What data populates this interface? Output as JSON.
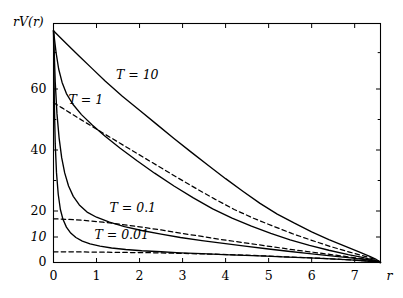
{
  "chart_data": {
    "type": "line",
    "title": "",
    "xlabel": "r",
    "ylabel": "rV(r)",
    "xlim": [
      0,
      7.6
    ],
    "ylim": [
      0,
      78
    ],
    "grid": false,
    "legend_position": "inline-annotations",
    "x_ticks": [
      "0",
      "1",
      "2",
      "3",
      "4",
      "5",
      "6",
      "7"
    ],
    "x_tick_values": [
      0,
      1,
      2,
      3,
      4,
      5,
      6,
      7
    ],
    "y_ticks": [
      "0",
      "10",
      "20",
      "40",
      "60"
    ],
    "y_tick_values": [
      0,
      10,
      20,
      40,
      60
    ],
    "y_minor_tick_values": [
      30,
      50,
      70
    ],
    "annotations": [
      {
        "text": "T = 10",
        "x": 1.45,
        "y": 63.5
      },
      {
        "text": "T = 1",
        "x": 0.35,
        "y": 56.0
      },
      {
        "text": "T = 0.1",
        "x": 1.3,
        "y": 20.5
      },
      {
        "text": "T = 0.01",
        "x": 0.95,
        "y": 10.5
      }
    ],
    "series": [
      {
        "name": "T = 10",
        "style": "solid",
        "color": "#000000",
        "points": [
          [
            0.0,
            76.0
          ],
          [
            0.15,
            74.2
          ],
          [
            0.35,
            71.9
          ],
          [
            0.6,
            69.0
          ],
          [
            0.9,
            65.6
          ],
          [
            1.2,
            62.2
          ],
          [
            1.6,
            57.6
          ],
          [
            2.0,
            53.0
          ],
          [
            2.4,
            48.4
          ],
          [
            2.8,
            43.8
          ],
          [
            3.2,
            39.3
          ],
          [
            3.6,
            34.9
          ],
          [
            4.0,
            30.6
          ],
          [
            4.4,
            26.5
          ],
          [
            4.8,
            22.5
          ],
          [
            5.2,
            18.8
          ],
          [
            5.6,
            15.3
          ],
          [
            6.0,
            12.0
          ],
          [
            6.4,
            9.0
          ],
          [
            6.8,
            6.2
          ],
          [
            7.1,
            4.2
          ],
          [
            7.35,
            2.4
          ],
          [
            7.5,
            1.2
          ],
          [
            7.58,
            0.3
          ],
          [
            7.6,
            0.0
          ]
        ]
      },
      {
        "name": "T = 1",
        "style": "solid",
        "color": "#000000",
        "points": [
          [
            0.0,
            76.0
          ],
          [
            0.06,
            70.0
          ],
          [
            0.12,
            65.5
          ],
          [
            0.2,
            61.8
          ],
          [
            0.3,
            58.5
          ],
          [
            0.45,
            55.0
          ],
          [
            0.65,
            51.6
          ],
          [
            0.9,
            48.2
          ],
          [
            1.2,
            44.5
          ],
          [
            1.55,
            40.6
          ],
          [
            1.95,
            36.4
          ],
          [
            2.35,
            32.4
          ],
          [
            2.8,
            28.2
          ],
          [
            3.25,
            24.3
          ],
          [
            3.7,
            20.7
          ],
          [
            4.15,
            17.3
          ],
          [
            4.6,
            14.2
          ],
          [
            5.05,
            11.4
          ],
          [
            5.5,
            8.9
          ],
          [
            5.95,
            6.7
          ],
          [
            6.4,
            4.8
          ],
          [
            6.85,
            3.1
          ],
          [
            7.15,
            2.1
          ],
          [
            7.4,
            1.1
          ],
          [
            7.55,
            0.4
          ],
          [
            7.6,
            0.0
          ]
        ]
      },
      {
        "name": "T = 1 asymptote",
        "style": "dashed",
        "color": "#000000",
        "points": [
          [
            0.0,
            55.5
          ],
          [
            0.2,
            53.8
          ],
          [
            0.45,
            51.6
          ],
          [
            0.75,
            49.0
          ],
          [
            1.1,
            46.0
          ],
          [
            1.5,
            42.6
          ],
          [
            1.95,
            38.8
          ],
          [
            2.4,
            35.0
          ],
          [
            2.85,
            31.2
          ],
          [
            3.3,
            27.5
          ],
          [
            3.75,
            23.9
          ],
          [
            4.2,
            20.5
          ],
          [
            4.65,
            17.2
          ],
          [
            5.1,
            14.2
          ],
          [
            5.55,
            11.3
          ],
          [
            6.0,
            8.7
          ],
          [
            6.45,
            6.2
          ],
          [
            6.9,
            4.0
          ],
          [
            7.2,
            2.6
          ],
          [
            7.45,
            1.3
          ],
          [
            7.6,
            0.3
          ]
        ]
      },
      {
        "name": "T = 0.1",
        "style": "solid",
        "color": "#000000",
        "points": [
          [
            0.0,
            76.0
          ],
          [
            0.04,
            62.0
          ],
          [
            0.08,
            52.0
          ],
          [
            0.13,
            44.0
          ],
          [
            0.19,
            37.5
          ],
          [
            0.26,
            32.5
          ],
          [
            0.35,
            28.2
          ],
          [
            0.46,
            24.8
          ],
          [
            0.6,
            22.0
          ],
          [
            0.78,
            19.6
          ],
          [
            1.0,
            17.6
          ],
          [
            1.3,
            15.7
          ],
          [
            1.65,
            14.0
          ],
          [
            2.05,
            12.5
          ],
          [
            2.5,
            11.1
          ],
          [
            2.95,
            9.8
          ],
          [
            3.45,
            8.6
          ],
          [
            3.95,
            7.5
          ],
          [
            4.45,
            6.4
          ],
          [
            4.95,
            5.4
          ],
          [
            5.45,
            4.4
          ],
          [
            5.95,
            3.5
          ],
          [
            6.45,
            2.6
          ],
          [
            6.9,
            1.8
          ],
          [
            7.2,
            1.2
          ],
          [
            7.45,
            0.6
          ],
          [
            7.6,
            0.1
          ]
        ]
      },
      {
        "name": "T = 0.1 asymptote",
        "style": "dashed",
        "color": "#000000",
        "points": [
          [
            0.0,
            17.0
          ],
          [
            0.3,
            16.8
          ],
          [
            0.7,
            16.4
          ],
          [
            1.15,
            15.7
          ],
          [
            1.6,
            14.8
          ],
          [
            2.05,
            13.8
          ],
          [
            2.5,
            12.7
          ],
          [
            2.95,
            11.5
          ],
          [
            3.45,
            10.2
          ],
          [
            3.95,
            8.9
          ],
          [
            4.45,
            7.7
          ],
          [
            4.95,
            6.5
          ],
          [
            5.45,
            5.3
          ],
          [
            5.95,
            4.2
          ],
          [
            6.45,
            3.1
          ],
          [
            6.9,
            2.1
          ],
          [
            7.2,
            1.4
          ],
          [
            7.45,
            0.7
          ],
          [
            7.6,
            0.1
          ]
        ]
      },
      {
        "name": "T = 0.01",
        "style": "solid",
        "color": "#000000",
        "points": [
          [
            0.0,
            76.0
          ],
          [
            0.02,
            55.0
          ],
          [
            0.04,
            42.0
          ],
          [
            0.07,
            32.5
          ],
          [
            0.11,
            25.5
          ],
          [
            0.16,
            20.5
          ],
          [
            0.22,
            16.8
          ],
          [
            0.3,
            13.8
          ],
          [
            0.4,
            11.5
          ],
          [
            0.52,
            9.8
          ],
          [
            0.67,
            8.4
          ],
          [
            0.85,
            7.3
          ],
          [
            1.08,
            6.4
          ],
          [
            1.35,
            5.7
          ],
          [
            1.68,
            5.1
          ],
          [
            2.05,
            4.6
          ],
          [
            2.5,
            4.2
          ],
          [
            2.95,
            3.8
          ],
          [
            3.45,
            3.5
          ],
          [
            3.95,
            3.1
          ],
          [
            4.45,
            2.8
          ],
          [
            4.95,
            2.5
          ],
          [
            5.45,
            2.1
          ],
          [
            5.95,
            1.8
          ],
          [
            6.45,
            1.4
          ],
          [
            6.9,
            1.0
          ],
          [
            7.2,
            0.7
          ],
          [
            7.45,
            0.3
          ],
          [
            7.6,
            0.0
          ]
        ]
      },
      {
        "name": "T = 0.01 asymptote",
        "style": "dashed",
        "color": "#000000",
        "points": [
          [
            0.0,
            4.2
          ],
          [
            0.4,
            4.2
          ],
          [
            0.9,
            4.1
          ],
          [
            1.4,
            4.0
          ],
          [
            1.9,
            3.9
          ],
          [
            2.4,
            3.8
          ],
          [
            2.9,
            3.6
          ],
          [
            3.4,
            3.4
          ],
          [
            3.9,
            3.2
          ],
          [
            4.4,
            2.9
          ],
          [
            4.9,
            2.6
          ],
          [
            5.4,
            2.2
          ],
          [
            5.9,
            1.9
          ],
          [
            6.4,
            1.5
          ],
          [
            6.9,
            1.0
          ],
          [
            7.2,
            0.7
          ],
          [
            7.45,
            0.3
          ],
          [
            7.6,
            0.0
          ]
        ]
      }
    ]
  }
}
